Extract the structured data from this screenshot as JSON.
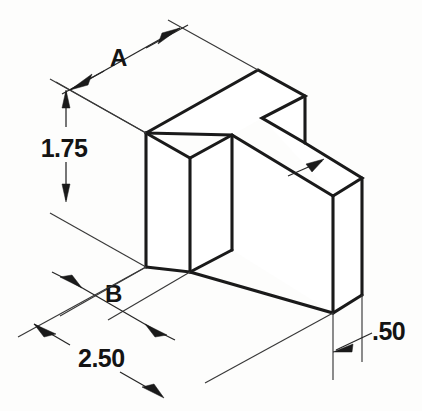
{
  "drawing": {
    "type": "isometric-technical-drawing",
    "subject": "L-shaped block with top notch",
    "background_color": "#fdfdfc",
    "line_color": "#1a1a1a",
    "dimension_color": "#262626",
    "dimensions": [
      {
        "id": "A",
        "label": "A",
        "kind": "unknown-letter-dimension",
        "orientation": "upper-left-isometric",
        "text_x": 120,
        "text_y": 66
      },
      {
        "id": "height",
        "label": "1.75",
        "kind": "linear",
        "orientation": "vertical",
        "text_x": 40,
        "text_y": 155
      },
      {
        "id": "B",
        "label": "B",
        "kind": "unknown-letter-dimension",
        "orientation": "lower-left-isometric",
        "text_x": 112,
        "text_y": 301
      },
      {
        "id": "width",
        "label": "2.50",
        "kind": "linear",
        "orientation": "lower-left-isometric",
        "text_x": 78,
        "text_y": 367
      },
      {
        "id": "thickness",
        "label": ".50",
        "kind": "linear",
        "orientation": "horizontal",
        "text_x": 374,
        "text_y": 339
      }
    ]
  }
}
